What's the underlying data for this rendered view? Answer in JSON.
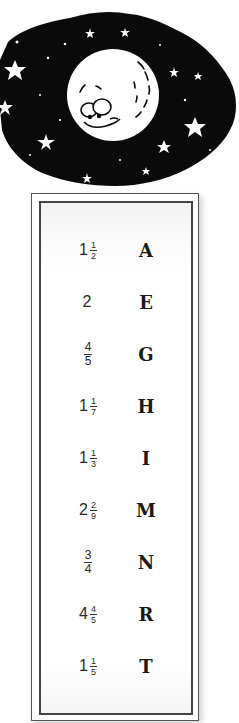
{
  "illustration": {
    "subject": "smiling moon in starry night sky",
    "icon": "moon-face-icon",
    "sky_color": "#0a0a0a",
    "moon_color": "#ffffff"
  },
  "decoder_key": {
    "rows": [
      {
        "whole": "1",
        "numerator": "1",
        "denominator": "2",
        "letter": "A"
      },
      {
        "whole": "2",
        "numerator": "",
        "denominator": "",
        "letter": "E"
      },
      {
        "whole": "",
        "numerator": "4",
        "denominator": "5",
        "letter": "G"
      },
      {
        "whole": "1",
        "numerator": "1",
        "denominator": "7",
        "letter": "H"
      },
      {
        "whole": "1",
        "numerator": "1",
        "denominator": "3",
        "letter": "I"
      },
      {
        "whole": "2",
        "numerator": "2",
        "denominator": "9",
        "letter": "M"
      },
      {
        "whole": "",
        "numerator": "3",
        "denominator": "4",
        "letter": "N"
      },
      {
        "whole": "4",
        "numerator": "4",
        "denominator": "5",
        "letter": "R"
      },
      {
        "whole": "1",
        "numerator": "1",
        "denominator": "5",
        "letter": "T"
      }
    ]
  }
}
